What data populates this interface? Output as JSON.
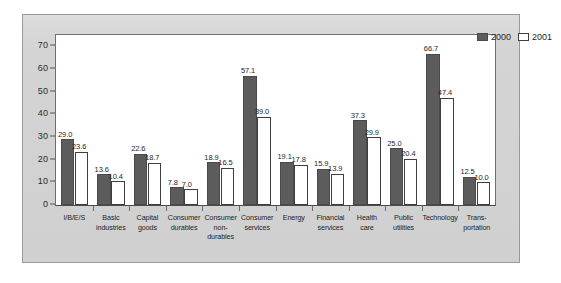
{
  "chart_data": {
    "type": "bar",
    "title": "",
    "subtitle": "",
    "xlabel": "",
    "ylabel": "",
    "ylim": [
      0,
      75
    ],
    "yticks": [
      0,
      10,
      20,
      30,
      40,
      50,
      60,
      70
    ],
    "ytick_labels": [
      "0",
      "10",
      "20",
      "30",
      "40",
      "50",
      "60",
      "70"
    ],
    "grid": false,
    "legend_position": "top-right",
    "categories": [
      "I/B/E/S",
      "Basic industries",
      "Capital goods",
      "Consumer durables",
      "Consumer non-durables",
      "Consumer services",
      "Energy",
      "Financial services",
      "Health care",
      "Public utilities",
      "Technology",
      "Transportation"
    ],
    "category_label_lines": [
      [
        "I/B/E/S"
      ],
      [
        "Basic",
        "industries"
      ],
      [
        "Capital",
        "goods"
      ],
      [
        "Consumer",
        "durables"
      ],
      [
        "Consumer",
        "non-",
        "durables"
      ],
      [
        "Consumer",
        "services"
      ],
      [
        "Energy"
      ],
      [
        "Financial",
        "services"
      ],
      [
        "Health",
        "care"
      ],
      [
        "Public",
        "utilities"
      ],
      [
        "Technology"
      ],
      [
        "Trans-",
        "portation"
      ]
    ],
    "series": [
      {
        "name": "2000",
        "color": "#5c5c5c",
        "values": [
          29.0,
          13.6,
          22.6,
          7.8,
          18.9,
          57.1,
          19.1,
          15.9,
          37.3,
          25.0,
          66.7,
          12.5
        ],
        "value_labels": [
          "29.0",
          "13.6",
          "22.6",
          "7.8",
          "18.9",
          "57.1",
          "19.1",
          "15.9",
          "37.3",
          "25.0",
          "66.7",
          "12.5"
        ]
      },
      {
        "name": "2001",
        "color": "#ffffff",
        "values": [
          23.6,
          10.4,
          18.7,
          7.0,
          16.5,
          39.0,
          17.8,
          13.9,
          29.9,
          20.4,
          47.4,
          10.0
        ],
        "value_labels": [
          "23.6",
          "10.4",
          "18.7",
          "7.0",
          "16.5",
          "39.0",
          "17.8",
          "13.9",
          "29.9",
          "20.4",
          "47.4",
          "10.0"
        ]
      }
    ],
    "legend": [
      {
        "label": "2000",
        "swatch": "filled-dark"
      },
      {
        "label": "2001",
        "swatch": "outlined-white"
      }
    ]
  },
  "colors": {
    "panel_background": "#d2d2d2",
    "plot_background": "#ffffff",
    "series_2000": "#5c5c5c",
    "series_2001": "#ffffff",
    "axis": "#4a4a4a",
    "text": "#1f1f1f"
  }
}
